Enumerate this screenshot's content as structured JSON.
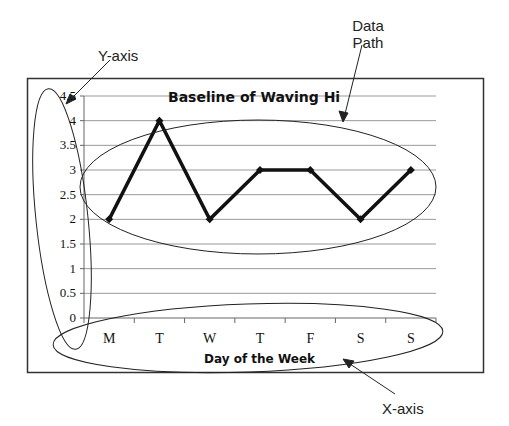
{
  "chart_data": {
    "type": "line",
    "title": "Baseline of Waving Hi",
    "xlabel": "Day of the Week",
    "ylabel": "",
    "categories": [
      "M",
      "T",
      "W",
      "T",
      "F",
      "S",
      "S"
    ],
    "series": [
      {
        "name": "Waving Hi",
        "values": [
          2,
          4,
          2,
          3,
          3,
          2,
          3
        ]
      }
    ],
    "ylim": [
      0,
      4.5
    ],
    "yticks": [
      "0",
      "0.5",
      "1",
      "1.5",
      "2",
      "2.5",
      "3",
      "3.5",
      "4",
      "4.5"
    ],
    "grid": true,
    "legend": "none",
    "annotations": [
      {
        "label": "Data Path",
        "target": "line series"
      },
      {
        "label": "Y-axis",
        "target": "y-axis"
      },
      {
        "label": "X-axis",
        "target": "x-axis"
      }
    ]
  },
  "labels": {
    "title": "Baseline of Waving Hi",
    "xlabel": "Day of the Week",
    "ann_data": "Data",
    "ann_path": "Path",
    "ann_yaxis": "Y-axis",
    "ann_xaxis": "X-axis"
  },
  "colors": {
    "line": "#111111",
    "grid": "#999999",
    "frame": "#333333"
  }
}
